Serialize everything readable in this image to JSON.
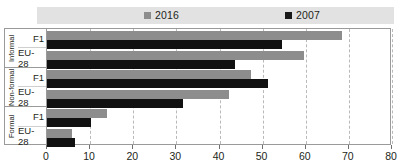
{
  "chart_data": {
    "type": "bar",
    "orientation": "horizontal",
    "title": "",
    "subtitle": "",
    "xlabel": "",
    "ylabel": "",
    "xlim": [
      0,
      80
    ],
    "xticks": [
      0,
      10,
      20,
      30,
      40,
      50,
      60,
      70,
      80
    ],
    "grid": true,
    "grid_style": "dashed-vertical",
    "legend_position": "top",
    "categories": [
      "F1",
      "EU-28",
      "F1",
      "EU-28",
      "F1",
      "EU-28"
    ],
    "groups": [
      {
        "name": "Informal",
        "categories": [
          "F1",
          "EU-28"
        ],
        "values_2016": [
          68.4,
          59.7
        ],
        "values_2007": [
          54.4,
          43.5
        ]
      },
      {
        "name": "Non-formal",
        "categories": [
          "F1",
          "EU-28"
        ],
        "values_2016": [
          47.4,
          42.3
        ],
        "values_2007": [
          51.2,
          31.6
        ]
      },
      {
        "name": "Formal",
        "categories": [
          "F1",
          "EU-28"
        ],
        "values_2016": [
          14.0,
          5.8
        ],
        "values_2007": [
          10.2,
          6.5
        ]
      }
    ],
    "series": [
      {
        "name": "2016",
        "color": "#8d8d8d",
        "values": [
          68.4,
          59.7,
          47.4,
          42.3,
          14.0,
          5.8
        ]
      },
      {
        "name": "2007",
        "color": "#111111",
        "values": [
          54.4,
          43.5,
          51.2,
          31.6,
          10.2,
          6.5
        ]
      }
    ]
  },
  "legend": {
    "background": "#e2e2e2",
    "entries": [
      {
        "label": "2016",
        "color": "#8d8d8d"
      },
      {
        "label": "2007",
        "color": "#111111"
      }
    ]
  },
  "axis": {
    "x_ticks": [
      "0",
      "10",
      "20",
      "30",
      "40",
      "50",
      "60",
      "70",
      "80"
    ]
  }
}
